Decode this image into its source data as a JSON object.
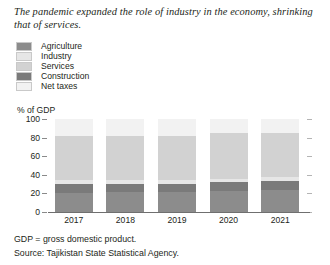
{
  "title": "The pandemic expanded the role of industry in the economy, shrinking that of services.",
  "axis_title": "% of GDP",
  "footnotes": {
    "definition": "GDP = gross domestic product.",
    "source": "Source: Tajikistan State Statistical Agency."
  },
  "colors": {
    "agriculture": "#8c8c8c",
    "industry": "#e6e6e6",
    "services": "#d2d2d2",
    "construction": "#7a7a7a",
    "net_taxes": "#f2f2f2",
    "axis": "#6f6f6f",
    "text": "#231f20",
    "tick_right": "#b4b4b4"
  },
  "legend": {
    "items": [
      {
        "label": "Agriculture",
        "color": "#8c8c8c"
      },
      {
        "label": "Industry",
        "color": "#e6e6e6"
      },
      {
        "label": "Services",
        "color": "#d2d2d2"
      },
      {
        "label": "Construction",
        "color": "#7a7a7a"
      },
      {
        "label": "Net taxes",
        "color": "#f2f2f2"
      }
    ]
  },
  "chart_data": {
    "type": "bar",
    "stacked": true,
    "title": "The pandemic expanded the role of industry in the economy, shrinking that of services.",
    "xlabel": "",
    "ylabel": "% of GDP",
    "ylim": [
      0,
      100
    ],
    "yticks": [
      0,
      20,
      40,
      60,
      80,
      100
    ],
    "grid": false,
    "legend_position": "top-left",
    "categories": [
      "2017",
      "2018",
      "2019",
      "2020",
      "2021"
    ],
    "series": [
      {
        "name": "Agriculture",
        "color": "#8c8c8c",
        "values": [
          20,
          21,
          21,
          23,
          24
        ]
      },
      {
        "name": "Construction",
        "color": "#7a7a7a",
        "values": [
          10,
          9,
          9,
          9,
          9
        ]
      },
      {
        "name": "Industry",
        "color": "#e6e6e6",
        "values": [
          4,
          4,
          4,
          4,
          5
        ]
      },
      {
        "name": "Services",
        "color": "#d2d2d2",
        "values": [
          48,
          48,
          48,
          49,
          47
        ]
      },
      {
        "name": "Net taxes",
        "color": "#f2f2f2",
        "values": [
          18,
          18,
          18,
          15,
          15
        ]
      }
    ]
  }
}
